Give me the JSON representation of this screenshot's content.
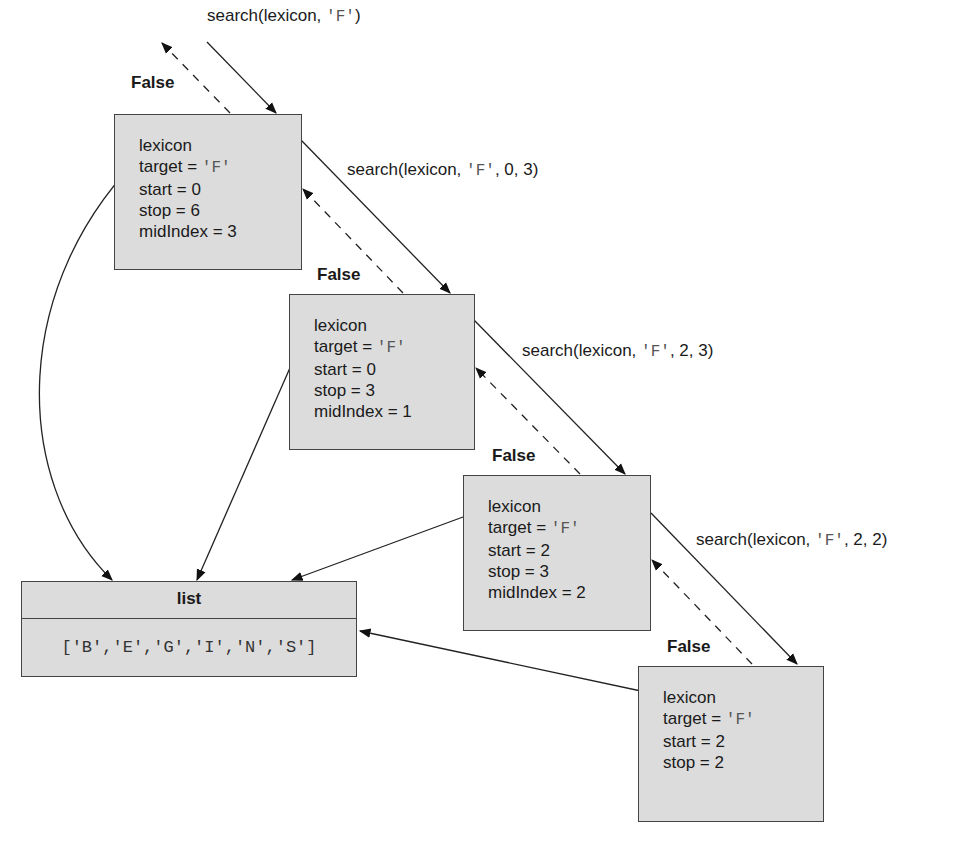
{
  "diagram": {
    "type": "recursive-call-trace",
    "calls": [
      {
        "label_prefix": "search(lexicon, ",
        "label_arg": "'F'",
        "label_suffix": ")"
      },
      {
        "label_prefix": "search(lexicon, ",
        "label_arg": "'F'",
        "label_suffix": ", 0, 3)"
      },
      {
        "label_prefix": "search(lexicon, ",
        "label_arg": "'F'",
        "label_suffix": ", 2, 3)"
      },
      {
        "label_prefix": "search(lexicon, ",
        "label_arg": "'F'",
        "label_suffix": ", 2, 2)"
      }
    ],
    "return_label": "False",
    "frames": [
      {
        "lexicon": "lexicon",
        "target_key": "target = ",
        "target_val": "'F'",
        "start": "start = 0",
        "stop": "stop = 6",
        "mid": "midIndex = 3"
      },
      {
        "lexicon": "lexicon",
        "target_key": "target = ",
        "target_val": "'F'",
        "start": "start = 0",
        "stop": "stop = 3",
        "mid": "midIndex = 1"
      },
      {
        "lexicon": "lexicon",
        "target_key": "target = ",
        "target_val": "'F'",
        "start": "start = 2",
        "stop": "stop = 3",
        "mid": "midIndex = 2"
      },
      {
        "lexicon": "lexicon",
        "target_key": "target = ",
        "target_val": "'F'",
        "start": "start = 2",
        "stop": "stop = 2"
      }
    ],
    "list": {
      "title": "list",
      "value": "['B','E','G','I','N','S']"
    }
  }
}
